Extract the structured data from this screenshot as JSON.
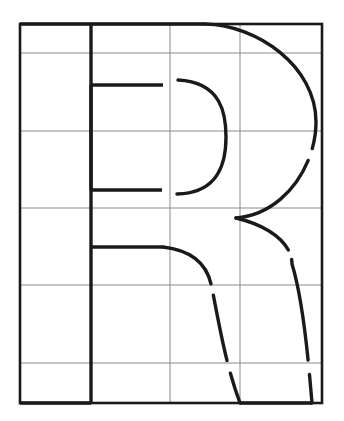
{
  "document": {
    "kind": "letterform-construction-diagram",
    "title": "Letter R construction grid",
    "glyph": "R",
    "typeface_style": "sans-serif-bold-geometric",
    "background_color": "#ffffff",
    "ink_color": "#1a1a1a",
    "grid_color": "#8a8a8a",
    "border_color": "#1a1a1a"
  },
  "canvas": {
    "width": 344,
    "height": 421
  },
  "grid": {
    "frame": {
      "x": 20,
      "y": 24,
      "width": 302,
      "height": 379
    },
    "border_stroke_width": 2.6,
    "line_stroke_width": 1.0,
    "columns_x": [
      20,
      91,
      170,
      240,
      322
    ],
    "rows_y": [
      24,
      53,
      131,
      208,
      285,
      363,
      403
    ],
    "column_count": 4,
    "row_count": 6,
    "vertical_lines": [
      91,
      170,
      240
    ],
    "horizontal_lines": [
      53,
      131,
      208,
      285,
      363
    ]
  },
  "glyph_geometry": {
    "stroke_width": 3.4,
    "stem": {
      "name": "left-stem",
      "x": 91,
      "y_top": 24,
      "y_bottom": 403
    },
    "cap_top_bar": {
      "name": "cap-top-bar",
      "x_start": 20,
      "x_end": 205,
      "y": 24
    },
    "baseline_bar": {
      "name": "baseline-bar",
      "x_start": 20,
      "x_end": 91,
      "y": 403
    },
    "counter_top_bar": {
      "name": "counter-top-bar",
      "x_start": 91,
      "x_end": 163,
      "y": 85
    },
    "counter_bottom_bar": {
      "name": "counter-bottom-bar",
      "x_start": 91,
      "x_end": 162,
      "y": 190
    },
    "counter_left_edge": {
      "name": "counter-left-edge",
      "x": 91,
      "y_top": 85,
      "y_bottom": 190
    },
    "leg_inner_top_bar": {
      "name": "leg-inner-top-bar",
      "x_start": 91,
      "x_end": 163,
      "y": 247
    },
    "leg_foot_bar": {
      "name": "leg-foot-bar",
      "x_start": 240,
      "x_end": 312,
      "y": 403
    },
    "bowl_outer_arc": {
      "name": "bowl-outer-arc",
      "start": [
        205,
        24
      ],
      "end": [
        236,
        218
      ],
      "apex_x": 316,
      "apex_y": 122,
      "break_gaps": [
        [
          311,
          148
        ],
        [
          315,
          163
        ]
      ]
    },
    "bowl_inner_arc": {
      "name": "bowl-inner-arc",
      "start": [
        178,
        80
      ],
      "end": [
        177,
        194
      ],
      "apex_x": 226,
      "apex_y": 137
    },
    "leg_outer_curve": {
      "name": "leg-outer-curve",
      "start": [
        236,
        218
      ],
      "end": [
        312,
        403
      ],
      "break_gaps": [
        [
          298,
          245
        ],
        [
          301,
          258
        ],
        [
          309,
          360
        ],
        [
          311,
          374
        ]
      ]
    },
    "leg_inner_curve": {
      "name": "leg-inner-curve",
      "start": [
        163,
        247
      ],
      "end": [
        240,
        403
      ],
      "break_gaps": [
        [
          214,
          283
        ],
        [
          215,
          295
        ],
        [
          229,
          360
        ],
        [
          231,
          373
        ]
      ]
    }
  },
  "annotations": {
    "labels": [],
    "caption": ""
  }
}
